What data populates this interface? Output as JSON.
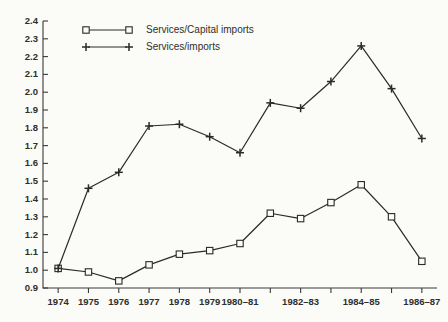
{
  "chart_data": {
    "type": "line",
    "title": "",
    "subtitle": "",
    "xlabel": "",
    "ylabel": "",
    "ylim": [
      0.9,
      2.4
    ],
    "ytick_step": 0.1,
    "yticks": [
      "2.4",
      "2.3",
      "2.2",
      "2.1",
      "2.0",
      "1.9",
      "1.8",
      "1.7",
      "1.6",
      "1.5",
      "1.4",
      "1.3",
      "1.2",
      "1.1",
      "1.0",
      "0.9"
    ],
    "categories": [
      "1974",
      "1975",
      "1976",
      "1977",
      "1978",
      "1979",
      "1980–81",
      "1981–82",
      "1982–83",
      "1983–84",
      "1984–85",
      "1985–86",
      "1986–87"
    ],
    "xtick_labels_shown": [
      "1974",
      "1975",
      "1976",
      "1977",
      "1978",
      "1979",
      "1980–81",
      "",
      "1982–83",
      "",
      "1984–85",
      "",
      "1986–87"
    ],
    "grid": false,
    "legend_position": "top-left-inside",
    "series": [
      {
        "name": "Services/Capital imports",
        "marker": "square",
        "values": [
          1.01,
          0.99,
          0.94,
          1.03,
          1.09,
          1.11,
          1.15,
          1.32,
          1.29,
          1.38,
          1.48,
          1.3,
          1.05
        ]
      },
      {
        "name": "Services/imports",
        "marker": "plus",
        "values": [
          1.01,
          1.46,
          1.55,
          1.81,
          1.82,
          1.75,
          1.66,
          1.94,
          1.91,
          2.06,
          2.26,
          2.02,
          1.74
        ]
      }
    ]
  },
  "legend": {
    "items": [
      {
        "label": "Services/Capital imports",
        "marker": "square"
      },
      {
        "label": "Services/imports",
        "marker": "plus"
      }
    ]
  },
  "colors": {
    "background": "#fbfbf7",
    "axis": "#3a3a3a",
    "line": "#2a2a2a",
    "text": "#2e2e2e"
  }
}
